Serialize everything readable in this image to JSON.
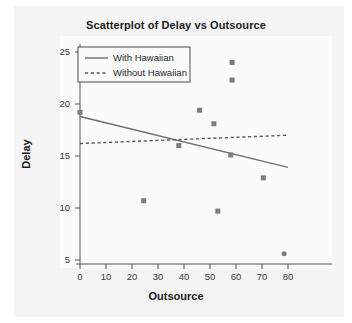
{
  "chart_data": {
    "type": "scatter",
    "title": "Scatterplot of Delay vs Outsource",
    "xlabel": "Outsource",
    "ylabel": "Delay",
    "xlim": [
      -4,
      84
    ],
    "ylim": [
      4.2,
      25.8
    ],
    "xticks": [
      0,
      10,
      20,
      30,
      40,
      50,
      60,
      70,
      80
    ],
    "yticks": [
      5,
      10,
      15,
      20,
      25
    ],
    "grid": false,
    "legend_position": "upper-left-inside",
    "points": [
      {
        "x": 0.0,
        "y": 19.2
      },
      {
        "x": 24.5,
        "y": 10.7
      },
      {
        "x": 38.0,
        "y": 16.0
      },
      {
        "x": 46.0,
        "y": 19.4
      },
      {
        "x": 51.5,
        "y": 18.1
      },
      {
        "x": 53.0,
        "y": 9.7
      },
      {
        "x": 58.5,
        "y": 24.0
      },
      {
        "x": 58.5,
        "y": 22.3
      },
      {
        "x": 58.0,
        "y": 15.1
      },
      {
        "x": 70.5,
        "y": 12.9
      },
      {
        "x": 78.5,
        "y": 5.6
      }
    ],
    "series": [
      {
        "name": "With Hawaiian",
        "style": "solid",
        "color": "#6e6e6e",
        "line": {
          "x0": 0,
          "y0": 18.8,
          "x1": 80,
          "y1": 13.9
        }
      },
      {
        "name": "Without Hawaiian",
        "style": "dashed",
        "color": "#5a5a5a",
        "line": {
          "x0": 0,
          "y0": 16.2,
          "x1": 80,
          "y1": 17.0
        }
      }
    ],
    "marker": {
      "shape": "square",
      "color": "#7b7b7b",
      "size": 5
    },
    "legend": [
      {
        "label": "With Hawaiian",
        "style": "solid"
      },
      {
        "label": "Without Hawaiian",
        "style": "dashed"
      }
    ]
  },
  "axis": {
    "x": {
      "label": "Outsource",
      "tick_labels": [
        "0",
        "10",
        "20",
        "30",
        "40",
        "50",
        "60",
        "70",
        "80"
      ]
    },
    "y": {
      "label": "Delay",
      "tick_labels": [
        "5",
        "10",
        "15",
        "20",
        "25"
      ]
    }
  },
  "colors": {
    "page_background": "#ffffff",
    "card_background": "#f4f4f4",
    "plot_background": "#fbfbfb",
    "axis": "#555555",
    "text": "#1b1b1b",
    "marker": "#7b7b7b",
    "fit_line": "#6e6e6e",
    "dashed_line": "#5a5a5a"
  }
}
